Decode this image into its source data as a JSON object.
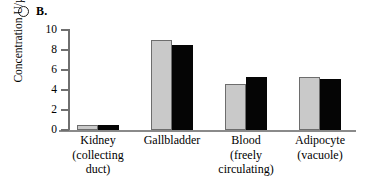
{
  "panel": {
    "marker_icon": "open-circle-icon",
    "letter": "B."
  },
  "chart_data": {
    "type": "bar",
    "title": "B.",
    "xlabel": "",
    "ylabel": "Concentration U/µL",
    "ylim": [
      0,
      10
    ],
    "yticks": [
      "0",
      "2",
      "4",
      "6",
      "8",
      "10"
    ],
    "grid": false,
    "legend": "none",
    "categories": [
      "Kidney\n(collecting\nduct)",
      "Gallbladder",
      "Blood\n(freely\ncirculating)",
      "Adipocyte\n(vacuole)"
    ],
    "category_lines": [
      [
        "Kidney",
        "(collecting",
        "duct)"
      ],
      [
        "Gallbladder"
      ],
      [
        "Blood",
        "(freely",
        "circulating)"
      ],
      [
        "Adipocyte",
        "(vacuole)"
      ]
    ],
    "series": [
      {
        "name": "gray",
        "color": "#c9c9c9",
        "values": [
          0.5,
          9.0,
          4.6,
          5.3
        ]
      },
      {
        "name": "black",
        "color": "#050505",
        "values": [
          0.55,
          8.5,
          5.3,
          5.1
        ]
      }
    ]
  }
}
